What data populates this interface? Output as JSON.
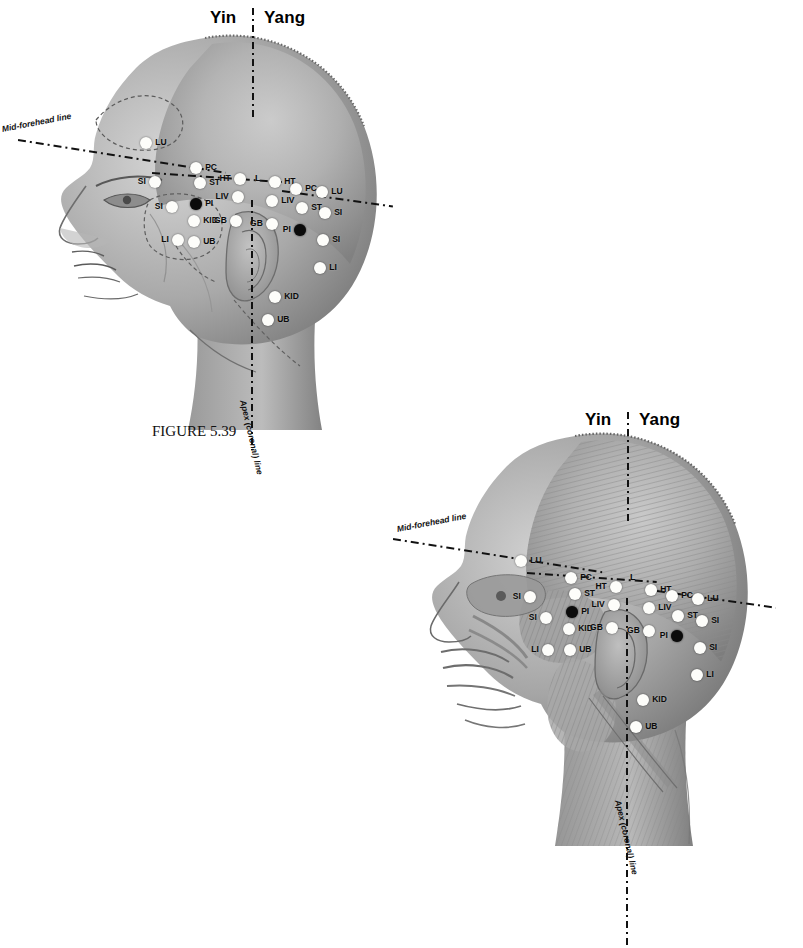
{
  "page": {
    "caption": "FIGURE 5.39",
    "background_color": "#ffffff",
    "point_color_light": "#fdfdfa",
    "point_color_dark": "#0b0b0b"
  },
  "labels": {
    "yin": "Yin",
    "yang": "Yang",
    "mid_forehead_line": "Mid-forehead line",
    "apex_coronal_line": "Apex (coronal) line",
    "center_marker": "L"
  },
  "figures": [
    {
      "id": "figure-top",
      "view": "skin-surface lateral head, facing left",
      "points": [
        {
          "code": "LU",
          "side": "yin",
          "type": "light",
          "x": 146,
          "y": 143
        },
        {
          "code": "SI",
          "side": "yin",
          "type": "light",
          "x": 155,
          "y": 182
        },
        {
          "code": "SI",
          "side": "yin",
          "type": "light",
          "x": 172,
          "y": 207
        },
        {
          "code": "LI",
          "side": "yin",
          "type": "light",
          "x": 178,
          "y": 240
        },
        {
          "code": "PC",
          "side": "yin",
          "type": "light",
          "x": 196,
          "y": 168
        },
        {
          "code": "ST",
          "side": "yin",
          "type": "light",
          "x": 200,
          "y": 183
        },
        {
          "code": "PI",
          "side": "yin",
          "type": "dark",
          "x": 196,
          "y": 204
        },
        {
          "code": "KID",
          "side": "yin",
          "type": "light",
          "x": 194,
          "y": 221
        },
        {
          "code": "UB",
          "side": "yin",
          "type": "light",
          "x": 194,
          "y": 242
        },
        {
          "code": "HT",
          "side": "yin",
          "type": "light",
          "x": 240,
          "y": 179
        },
        {
          "code": "LIV",
          "side": "yin",
          "type": "light",
          "x": 238,
          "y": 197
        },
        {
          "code": "GB",
          "side": "yin",
          "type": "light",
          "x": 236,
          "y": 221
        },
        {
          "code": "HT",
          "side": "yang",
          "type": "light",
          "x": 275,
          "y": 182
        },
        {
          "code": "LIV",
          "side": "yang",
          "type": "light",
          "x": 272,
          "y": 201
        },
        {
          "code": "GB",
          "side": "yang",
          "type": "light",
          "x": 272,
          "y": 224
        },
        {
          "code": "PC",
          "side": "yang",
          "type": "light",
          "x": 296,
          "y": 189
        },
        {
          "code": "ST",
          "side": "yang",
          "type": "light",
          "x": 302,
          "y": 208
        },
        {
          "code": "PI",
          "side": "yang",
          "type": "dark",
          "x": 300,
          "y": 230
        },
        {
          "code": "LU",
          "side": "yang",
          "type": "light",
          "x": 322,
          "y": 192
        },
        {
          "code": "SI",
          "side": "yang",
          "type": "light",
          "x": 325,
          "y": 213
        },
        {
          "code": "SI",
          "side": "yang",
          "type": "light",
          "x": 323,
          "y": 240
        },
        {
          "code": "LI",
          "side": "yang",
          "type": "light",
          "x": 320,
          "y": 268
        },
        {
          "code": "KID",
          "side": "yang",
          "type": "light",
          "x": 275,
          "y": 297
        },
        {
          "code": "UB",
          "side": "yang",
          "type": "light",
          "x": 268,
          "y": 320
        }
      ]
    },
    {
      "id": "figure-bottom",
      "view": "musculature lateral head, facing left",
      "points": [
        {
          "code": "LU",
          "side": "yin",
          "type": "light",
          "x": 521,
          "y": 561
        },
        {
          "code": "SI",
          "side": "yin",
          "type": "light",
          "x": 530,
          "y": 597
        },
        {
          "code": "SI",
          "side": "yin",
          "type": "light",
          "x": 546,
          "y": 618
        },
        {
          "code": "LI",
          "side": "yin",
          "type": "light",
          "x": 548,
          "y": 650
        },
        {
          "code": "PC",
          "side": "yin",
          "type": "light",
          "x": 571,
          "y": 578
        },
        {
          "code": "ST",
          "side": "yin",
          "type": "light",
          "x": 575,
          "y": 594
        },
        {
          "code": "PI",
          "side": "yin",
          "type": "dark",
          "x": 572,
          "y": 612
        },
        {
          "code": "KID",
          "side": "yin",
          "type": "light",
          "x": 569,
          "y": 629
        },
        {
          "code": "UB",
          "side": "yin",
          "type": "light",
          "x": 570,
          "y": 650
        },
        {
          "code": "HT",
          "side": "yin",
          "type": "light",
          "x": 616,
          "y": 587
        },
        {
          "code": "LIV",
          "side": "yin",
          "type": "light",
          "x": 614,
          "y": 605
        },
        {
          "code": "GB",
          "side": "yin",
          "type": "light",
          "x": 612,
          "y": 628
        },
        {
          "code": "HT",
          "side": "yang",
          "type": "light",
          "x": 651,
          "y": 590
        },
        {
          "code": "LIV",
          "side": "yang",
          "type": "light",
          "x": 649,
          "y": 608
        },
        {
          "code": "GB",
          "side": "yang",
          "type": "light",
          "x": 649,
          "y": 631
        },
        {
          "code": "PC",
          "side": "yang",
          "type": "light",
          "x": 672,
          "y": 596
        },
        {
          "code": "ST",
          "side": "yang",
          "type": "light",
          "x": 678,
          "y": 616
        },
        {
          "code": "PI",
          "side": "yang",
          "type": "dark",
          "x": 677,
          "y": 636
        },
        {
          "code": "LU",
          "side": "yang",
          "type": "light",
          "x": 698,
          "y": 599
        },
        {
          "code": "SI",
          "side": "yang",
          "type": "light",
          "x": 702,
          "y": 621
        },
        {
          "code": "SI",
          "side": "yang",
          "type": "light",
          "x": 700,
          "y": 648
        },
        {
          "code": "LI",
          "side": "yang",
          "type": "light",
          "x": 697,
          "y": 675
        },
        {
          "code": "KID",
          "side": "yang",
          "type": "light",
          "x": 643,
          "y": 700
        },
        {
          "code": "UB",
          "side": "yang",
          "type": "light",
          "x": 636,
          "y": 727
        }
      ]
    }
  ]
}
